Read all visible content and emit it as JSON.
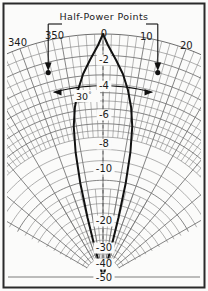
{
  "figure": {
    "name": "polar-antenna-radiation-pattern",
    "background_color": "#fbfbfa",
    "border_color": "#2a2a2a",
    "grid_color": "#6e6e6e",
    "pattern_color": "#111111",
    "annotation_color": "#111111"
  },
  "header": {
    "label": "Half-Power Points"
  },
  "beamwidth": {
    "label": "30",
    "degree_symbol": "°"
  },
  "chart_data": {
    "type": "line",
    "title": "Half-Power Points",
    "subtitle": "",
    "xlabel": "Azimuth angle (degrees)",
    "ylabel": "Relative power (dB)",
    "projection": "polar",
    "grid": true,
    "legend": false,
    "origin_px": [
      103,
      277
    ],
    "radius_px": 243,
    "angle_labels": [
      "340",
      "350",
      "0",
      "10",
      "20"
    ],
    "angle_values": [
      340,
      350,
      0,
      10,
      20
    ],
    "angle_tick_step_deg": 2,
    "angle_major_step_deg": 10,
    "db_labels": [
      "-2",
      "-4",
      "-6",
      "-8",
      "-10",
      "-20",
      "-30",
      "-40",
      "-50"
    ],
    "db_values": [
      -2,
      -4,
      -6,
      -8,
      -10,
      -20,
      -30,
      -40,
      -50
    ],
    "db_axis_min": -50,
    "db_axis_max": 0,
    "beamwidth_deg": 30,
    "half_power_level_db": -3,
    "half_power_angles_deg": [
      -15,
      15
    ],
    "series": [
      {
        "name": "Main lobe pattern",
        "angles_deg": [
          -15.6,
          -15.2,
          -14.6,
          -13.6,
          -12.4,
          -11.0,
          -9.4,
          -7.6,
          -5.6,
          -3.4,
          -1.2,
          0,
          1.2,
          3.4,
          5.6,
          7.6,
          9.4,
          11.0,
          12.4,
          13.6,
          14.6,
          15.2,
          15.6
        ],
        "values_db": [
          -50,
          -40,
          -30,
          -20,
          -14,
          -10,
          -7.5,
          -5.5,
          -3.8,
          -2.4,
          -1.0,
          0,
          -1.0,
          -2.4,
          -3.8,
          -5.5,
          -7.5,
          -10,
          -14,
          -20,
          -30,
          -40,
          -50
        ]
      }
    ],
    "markers": [
      {
        "name": "half-power-point-left",
        "angle_deg": -15,
        "value_db": -3
      },
      {
        "name": "half-power-point-right",
        "angle_deg": 15,
        "value_db": -3
      }
    ]
  }
}
